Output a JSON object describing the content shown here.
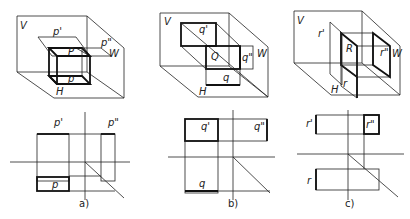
{
  "figures": [
    {
      "id": "a",
      "caption": "a)",
      "plane_labels": {
        "V": "V",
        "H": "H",
        "W": "W"
      },
      "object_labels": {
        "main": "P",
        "front": "p'",
        "side": "p\"",
        "top": "p"
      },
      "description": "Horizontal plane P: front view p' is a line, side view p\" is a line, top view p shows true shape"
    },
    {
      "id": "b",
      "caption": "b)",
      "plane_labels": {
        "V": "V",
        "H": "H",
        "W": "W"
      },
      "object_labels": {
        "main": "Q",
        "front": "q'",
        "side": "q\"",
        "top": "q"
      },
      "description": "Frontal plane Q: front view q' shows true shape, side and top views are lines"
    },
    {
      "id": "c",
      "caption": "c)",
      "plane_labels": {
        "V": "V",
        "H": "H",
        "W": "W"
      },
      "object_labels": {
        "main": "R",
        "front": "r'",
        "side": "r\"",
        "top": "r"
      },
      "description": "Profile plane R: side view r\" shows true shape, front and top views are lines"
    }
  ]
}
